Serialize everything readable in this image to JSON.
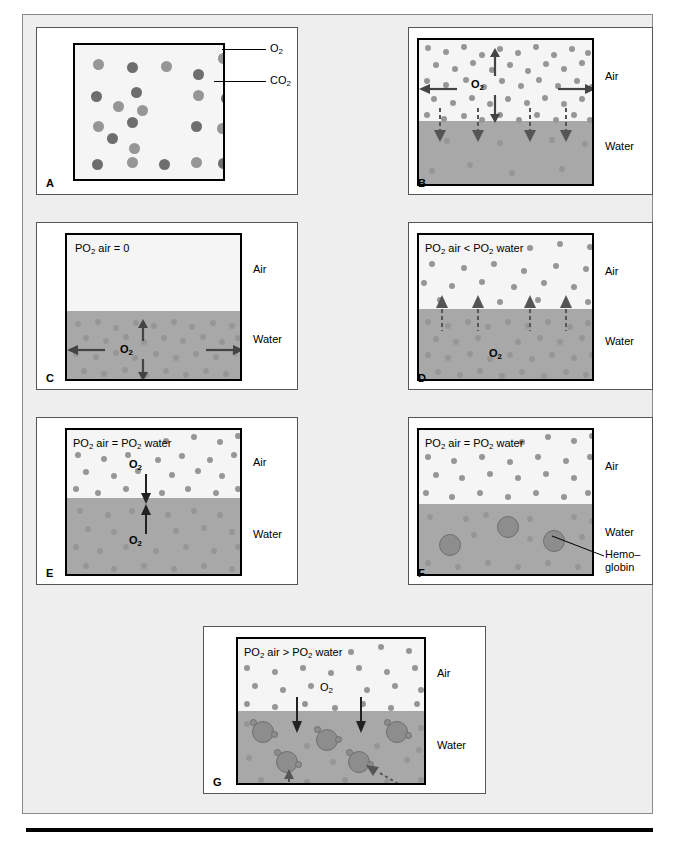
{
  "figure": {
    "background_color": "#eeeeee",
    "panel_background": "#ffffff",
    "air_color": "#f5f5f5",
    "water_color": "#a8a8a8",
    "o2_color": "#969696",
    "co2_color": "#6e6e6e"
  },
  "labels": {
    "air": "Air",
    "water": "Water",
    "o2": "O",
    "o2_sub": "2",
    "co2": "CO",
    "co2_sub": "2",
    "hemoglobin_line1": "Hemo–",
    "hemoglobin_line2": "globin"
  },
  "panels": [
    {
      "letter": "A",
      "condition": "",
      "legend": [
        {
          "name": "O2",
          "text": "O",
          "sub": "2",
          "color": "#969696"
        },
        {
          "name": "CO2",
          "text": "CO",
          "sub": "2",
          "color": "#6e6e6e"
        }
      ],
      "description": "Mixed O2 and CO2 molecules in a gas volume, legend callouts"
    },
    {
      "letter": "B",
      "condition": "",
      "o2_tag": "O",
      "o2_tag_sub": "2",
      "air_label": "Air",
      "water_label": "Water",
      "description": "Dense O2 in air, dashed arrows diffusing down into water"
    },
    {
      "letter": "C",
      "condition": "PO2 air = 0",
      "condition_parts": [
        "PO",
        "2",
        " air = 0"
      ],
      "o2_tag": "O",
      "o2_tag_sub": "2",
      "air_label": "Air",
      "water_label": "Water",
      "description": "No O2 in air, dense O2 in water moving within water"
    },
    {
      "letter": "D",
      "condition": "PO2 air < PO2 water",
      "condition_parts": [
        "PO",
        "2",
        " air < PO",
        "2",
        " water"
      ],
      "o2_tag": "O",
      "o2_tag_sub": "2",
      "air_label": "Air",
      "water_label": "Water",
      "description": "O2 diffuses upward from water into air, dashed up arrows"
    },
    {
      "letter": "E",
      "condition": "PO2 air = PO2 water",
      "condition_parts": [
        "PO",
        "2",
        " air = PO",
        "2",
        " water"
      ],
      "o2_tag_top": "O",
      "o2_tag_top_sub": "2",
      "o2_tag_bottom": "O",
      "o2_tag_bottom_sub": "2",
      "air_label": "Air",
      "water_label": "Water",
      "description": "Equilibrium, equal exchange arrows down and up"
    },
    {
      "letter": "F",
      "condition": "PO2 air = PO2 water",
      "condition_parts": [
        "PO",
        "2",
        " air = PO",
        "2",
        " water"
      ],
      "air_label": "Air",
      "water_label": "Water",
      "hemoglobin_label_line1": "Hemo–",
      "hemoglobin_label_line2": "globin",
      "description": "Hemoglobin molecules present in water at equilibrium"
    },
    {
      "letter": "G",
      "condition": "PO2 air > PO2 water",
      "condition_parts": [
        "PO",
        "2",
        " air > PO",
        "2",
        " water"
      ],
      "o2_tag": "O",
      "o2_tag_sub": "2",
      "air_label": "Air",
      "water_label": "Water",
      "description": "High air PO2 drives O2 into water where hemoglobin binds it"
    }
  ]
}
